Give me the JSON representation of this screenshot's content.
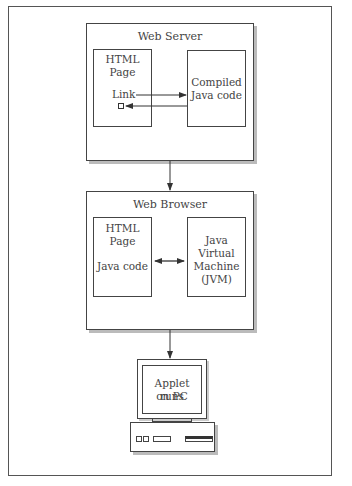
{
  "diagram": {
    "web_server": {
      "title": "Web Server",
      "html_page": {
        "line1": "HTML",
        "line2": "Page",
        "link": "Link"
      },
      "compiled": {
        "line1": "Compiled",
        "line2": "Java code"
      }
    },
    "web_browser": {
      "title": "Web Browser",
      "html_page": {
        "line1": "HTML",
        "line2": "Page",
        "java": "Java code"
      },
      "jvm": {
        "line1": "Java",
        "line2": "Virtual",
        "line3": "Machine",
        "line4": "(JVM)"
      }
    },
    "pc": {
      "line1": "Applet runs",
      "line2": "on PC"
    }
  }
}
